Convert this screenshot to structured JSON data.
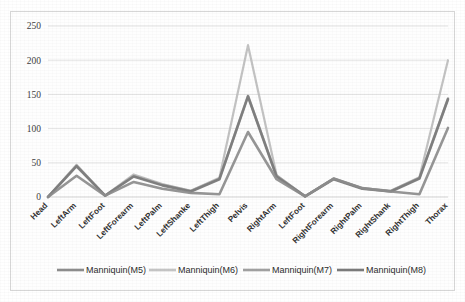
{
  "chart_data": {
    "type": "line",
    "title": "",
    "subtitle": "",
    "xlabel": "",
    "ylabel": "",
    "ylim": [
      0,
      250
    ],
    "yticks": [
      0,
      50,
      100,
      150,
      200,
      250
    ],
    "grid": true,
    "legend_position": "bottom",
    "categories": [
      "Head",
      "LeftArm",
      "LeftFoot",
      "LeftForearm",
      "LeftPalm",
      "LeftShanke",
      "LeftThigh",
      "Pelvis",
      "RightArm",
      "LeftFoot",
      "RightForearm",
      "RightPalm",
      "RightShank",
      "RightThigh",
      "Thorax"
    ],
    "series": [
      {
        "name": "Manniquin(M5)",
        "color": "#8c8c8c",
        "values": [
          0,
          31,
          2,
          22,
          12,
          6,
          4,
          95,
          26,
          1,
          27,
          13,
          8,
          4,
          101
        ]
      },
      {
        "name": "Manniquin(M6)",
        "color": "#bdbdbd",
        "values": [
          0,
          47,
          2,
          33,
          19,
          9,
          28,
          222,
          32,
          1,
          27,
          13,
          9,
          29,
          200
        ]
      },
      {
        "name": "Manniquin(M7)",
        "color": "#a8a8a8",
        "values": [
          0,
          46,
          2,
          31,
          18,
          9,
          27,
          148,
          31,
          1,
          27,
          13,
          9,
          28,
          144
        ]
      },
      {
        "name": "Manniquin(M8)",
        "color": "#7a7a7a",
        "values": [
          0,
          45,
          2,
          30,
          17,
          8,
          26,
          147,
          30,
          1,
          26,
          12,
          8,
          27,
          143
        ]
      }
    ]
  },
  "axis": {
    "ytick_labels": [
      "250",
      "200",
      "150",
      "100",
      "50",
      "0"
    ]
  },
  "legend": {
    "entries": [
      {
        "label": "Manniquin(M5)",
        "color": "#8c8c8c"
      },
      {
        "label": "Manniquin(M6)",
        "color": "#c4c4c4"
      },
      {
        "label": "Manniquin(M7)",
        "color": "#a0a0a0"
      },
      {
        "label": "Manniquin(M8)",
        "color": "#7a7a7a"
      }
    ]
  }
}
